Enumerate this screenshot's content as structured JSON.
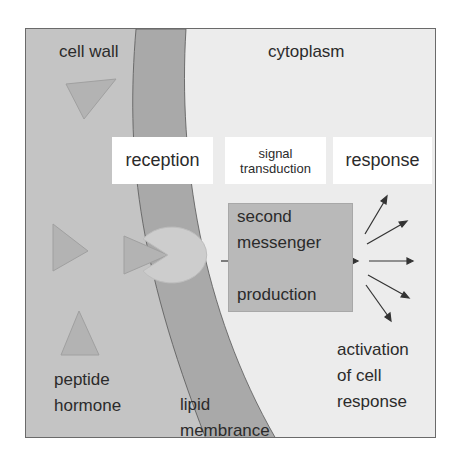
{
  "diagram": {
    "type": "signal-transduction-schematic",
    "regions": {
      "cell_wall": "cell wall",
      "cytoplasm": "cytoplasm"
    },
    "stages": [
      {
        "id": "reception",
        "label": "reception"
      },
      {
        "id": "signal-transduction",
        "label": "signal transduction",
        "line1": "signal",
        "line2": "transduction"
      },
      {
        "id": "response",
        "label": "response"
      }
    ],
    "second_messenger_box": {
      "line1": "second",
      "line2": "messenger",
      "line3": "production"
    },
    "labels": {
      "peptide_hormone_1": "peptide",
      "peptide_hormone_2": "hormone",
      "lipid_membrane_1": "lipid",
      "lipid_membrane_2": "membrance",
      "activation_1": "activation",
      "activation_2": "of cell",
      "activation_3": "response"
    },
    "colors": {
      "cell_wall": "#c4c4c4",
      "membrane": "#a9a9a9",
      "cytoplasm": "#ececec",
      "hormone": "#b3b3b3",
      "receptor": "#cdcdcd",
      "messenger_box": "#b9b9b9"
    }
  }
}
